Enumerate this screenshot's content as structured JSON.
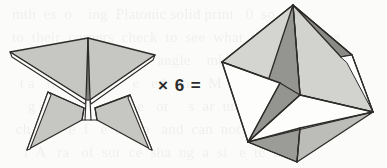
{
  "figure": {
    "caption_operator": "× 6 =",
    "background_color": "#fbfbf9",
    "stroke_color": "#2e2c2a",
    "bleed_through_text": "  mth  es  o    ing  Platonic solid print   0  so\n  to  their  corners  check  to  see  what  they  look like\n     uares    faces      ce    angle    mbin     d  ur\n    t a   ti     d      s     e   ed   the   M   a  i  on\n      g   tion           ne  e   or     s  ar  un  qu  the\n   ch   an   e  f   e  a  mo   and  can  not  e  th  nine\n     l  A   ra   of  sur  ce  sha  ng  a  si   e  te  und\n     ed    of  tet   hedral  in   s  eight  in   gl  which\n      e   at  the   v  ex   re     wh      ti  ng    the  10 di s of",
    "shapes": {
      "left": {
        "name": "star-tetrahedron-net-piece",
        "fill_light": "#c9c9c6",
        "fill_mid": "#bfbfbc",
        "fill_white": "#fdfdfc"
      },
      "right": {
        "name": "assembled-polyhedron",
        "fill_light": "#d4d4d1",
        "fill_mid": "#b4b4b1",
        "fill_dark": "#8e8e8b",
        "fill_darker": "#7c7c79",
        "fill_white": "#ffffff"
      }
    }
  }
}
